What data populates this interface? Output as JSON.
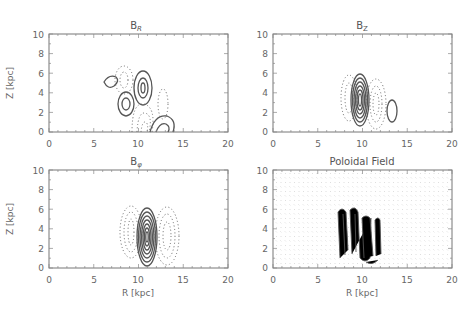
{
  "figure": {
    "panels": [
      {
        "id": "br",
        "title": "B",
        "subscript": "R",
        "xlabel": "",
        "ylabel": "Z [kpc]",
        "frame": {
          "x0": 49,
          "y0": 34,
          "x1": 228,
          "y1": 132
        }
      },
      {
        "id": "bz",
        "title": "B",
        "subscript": "Z",
        "xlabel": "",
        "ylabel": "",
        "frame": {
          "x0": 273,
          "y0": 34,
          "x1": 452,
          "y1": 132
        }
      },
      {
        "id": "bphi",
        "title": "B",
        "subscript": "φ",
        "xlabel": "R [kpc]",
        "ylabel": "Z [kpc]",
        "frame": {
          "x0": 49,
          "y0": 170,
          "x1": 228,
          "y1": 268
        }
      },
      {
        "id": "pol",
        "title": "Poloidal Field",
        "subscript": "",
        "xlabel": "R [kpc]",
        "ylabel": "",
        "frame": {
          "x0": 273,
          "y0": 170,
          "x1": 452,
          "y1": 268
        }
      }
    ],
    "xticks": [
      "0",
      "5",
      "10",
      "15",
      "20"
    ],
    "yticks": [
      "0",
      "2",
      "4",
      "6",
      "8",
      "10"
    ]
  },
  "chart_data": [
    {
      "type": "contour",
      "title": "B_R",
      "xlabel": "",
      "ylabel": "Z [kpc]",
      "xlim": [
        0,
        20
      ],
      "ylim": [
        0,
        10
      ],
      "x_ticks": [
        0,
        5,
        10,
        15,
        20
      ],
      "y_ticks": [
        0,
        2,
        4,
        6,
        8,
        10
      ],
      "features": [
        {
          "sign": "positive",
          "style": "solid",
          "center": [
            10.5,
            4.5
          ],
          "levels": 3
        },
        {
          "sign": "positive",
          "style": "solid",
          "center": [
            8.5,
            2.8
          ],
          "levels": 2
        },
        {
          "sign": "positive",
          "style": "solid",
          "center": [
            6.8,
            4.9
          ],
          "levels": 1
        },
        {
          "sign": "positive",
          "style": "solid",
          "center": [
            12.2,
            0.5
          ],
          "levels": 2
        },
        {
          "sign": "negative",
          "style": "dotted",
          "center": [
            8.3,
            5.5
          ],
          "levels": 2
        },
        {
          "sign": "negative",
          "style": "dotted",
          "center": [
            10.2,
            1.5
          ],
          "levels": 3
        },
        {
          "sign": "negative",
          "style": "dotted",
          "center": [
            12.7,
            3.0
          ],
          "levels": 1
        }
      ]
    },
    {
      "type": "contour",
      "title": "B_Z",
      "xlabel": "",
      "ylabel": "",
      "xlim": [
        0,
        20
      ],
      "ylim": [
        0,
        10
      ],
      "x_ticks": [
        0,
        5,
        10,
        15,
        20
      ],
      "y_ticks": [
        0,
        2,
        4,
        6,
        8,
        10
      ],
      "features": [
        {
          "sign": "positive",
          "style": "solid",
          "center": [
            9.7,
            3.4
          ],
          "levels": 6
        },
        {
          "sign": "positive",
          "style": "solid",
          "center": [
            13.2,
            2.2
          ],
          "levels": 1
        },
        {
          "sign": "negative",
          "style": "dotted",
          "center": [
            8.3,
            3.5
          ],
          "levels": 2
        },
        {
          "sign": "negative",
          "style": "dotted",
          "center": [
            11.5,
            2.8
          ],
          "levels": 3
        }
      ]
    },
    {
      "type": "contour",
      "title": "B_phi",
      "xlabel": "R [kpc]",
      "ylabel": "Z [kpc]",
      "xlim": [
        0,
        20
      ],
      "ylim": [
        0,
        10
      ],
      "x_ticks": [
        0,
        5,
        10,
        15,
        20
      ],
      "y_ticks": [
        0,
        2,
        4,
        6,
        8,
        10
      ],
      "features": [
        {
          "sign": "positive",
          "style": "solid",
          "center": [
            11.0,
            3.3
          ],
          "levels": 7
        },
        {
          "sign": "negative",
          "style": "dotted",
          "center": [
            9.0,
            3.8
          ],
          "levels": 3
        },
        {
          "sign": "negative",
          "style": "dotted",
          "center": [
            13.2,
            3.2
          ],
          "levels": 3
        }
      ]
    },
    {
      "type": "vector",
      "title": "Poloidal Field",
      "xlabel": "R [kpc]",
      "ylabel": "",
      "xlim": [
        0,
        20
      ],
      "ylim": [
        0,
        10
      ],
      "x_ticks": [
        0,
        5,
        10,
        15,
        20
      ],
      "y_ticks": [
        0,
        2,
        4,
        6,
        8,
        10
      ],
      "features": [
        {
          "description": "closed loop structure of strong vectors",
          "r_range": [
            8,
            12
          ],
          "z_range": [
            0.5,
            6
          ]
        }
      ]
    }
  ]
}
